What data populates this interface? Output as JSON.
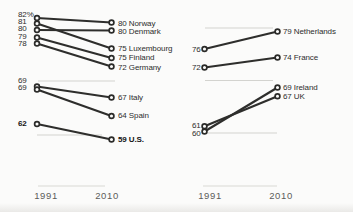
{
  "colors": {
    "slope_line": "#2e2e2c",
    "point_stroke": "#2b2b29",
    "point_fill": "#fbfbfa",
    "gridline": "#d3d3cf",
    "axis_line": "#d9d9d4",
    "label_text": "#2d2d2d",
    "bold_text": "#141414",
    "year_text": "#5d5d5a",
    "background": "#fbfbfa"
  },
  "chart_data": {
    "type": "line",
    "subtype": "slopegraph",
    "title": "",
    "x_categories": [
      "1991",
      "2010"
    ],
    "legend": "none",
    "grid": "partial-horizontal-rules",
    "panels": [
      {
        "name": "left-panel",
        "value_label_x": 18,
        "country_label_x": 118,
        "col_x_1991": 37,
        "col_x_2010": 111.5,
        "gridlines": [
          {
            "y": 81,
            "x1": 38,
            "x2": 115
          },
          {
            "y": 135,
            "x1": 37,
            "x2": 102
          }
        ],
        "axis": {
          "y": 186,
          "x1": 38,
          "x2": 105,
          "year1_cx": 46,
          "year2_cx": 107,
          "year_label_top": 190
        },
        "series": [
          {
            "country": "Norway",
            "v1991": 82,
            "v2010": 80,
            "label_left": "82%",
            "label_right": "80 Norway",
            "bold": false,
            "y1": 18,
            "y2": 22.5,
            "label_left_y": 14.5,
            "label_right_y": 24
          },
          {
            "country": "Luxembourg",
            "v1991": 81,
            "v2010": 75,
            "label_left": "81",
            "label_right": "75 Luxembourg",
            "bold": false,
            "y1": 23.5,
            "y2": 48.5,
            "label_left_y": 21.5,
            "label_right_y": 48.5
          },
          {
            "country": "Denmark",
            "v1991": 80,
            "v2010": 80,
            "label_left": "80",
            "label_right": "80 Denmark",
            "bold": false,
            "y1": 30,
            "y2": 30.5,
            "label_left_y": 29,
            "label_right_y": 31.5
          },
          {
            "country": "Finland",
            "v1991": 79,
            "v2010": 75,
            "label_left": "79",
            "label_right": "75 Finland",
            "bold": false,
            "y1": 37.5,
            "y2": 58,
            "label_left_y": 36.5,
            "label_right_y": 58
          },
          {
            "country": "Germany",
            "v1991": 78,
            "v2010": 72,
            "label_left": "78",
            "label_right": "72 Germany",
            "bold": false,
            "y1": 43.5,
            "y2": 66.5,
            "label_left_y": 44,
            "label_right_y": 67.5
          },
          {
            "country": "Italy",
            "v1991": 69,
            "v2010": 67,
            "label_left": "69",
            "label_right": "67 Italy",
            "bold": false,
            "y1": 86.5,
            "y2": 97.5,
            "label_left_y": 80.5,
            "label_right_y": 97.5
          },
          {
            "country": "Spain",
            "v1991": 69,
            "v2010": 64,
            "label_left": "69",
            "label_right": "64 Spain",
            "bold": false,
            "y1": 89.5,
            "y2": 116,
            "label_left_y": 87.5,
            "label_right_y": 116
          },
          {
            "country": "U.S.",
            "v1991": 62,
            "v2010": 59,
            "label_left": "62",
            "label_right": "59 U.S.",
            "bold": true,
            "y1": 124,
            "y2": 139.5,
            "label_left_y": 123.5,
            "label_right_y": 139.5
          }
        ]
      },
      {
        "name": "right-panel",
        "value_label_x": 192,
        "country_label_x": 283,
        "col_x_1991": 204.5,
        "col_x_2010": 277.5,
        "gridlines": [
          {
            "y": 28,
            "x1": 205,
            "x2": 273
          },
          {
            "y": 80.5,
            "x1": 205,
            "x2": 273
          },
          {
            "y": 133,
            "x1": 207,
            "x2": 277
          }
        ],
        "axis": {
          "y": 186,
          "x1": 203,
          "x2": 277,
          "year1_cx": 210,
          "year2_cx": 281,
          "year_label_top": 190
        },
        "series": [
          {
            "country": "Netherlands",
            "v1991": 76,
            "v2010": 79,
            "label_left": "76",
            "label_right": "79 Netherlands",
            "bold": false,
            "y1": 49,
            "y2": 31.5,
            "label_left_y": 50,
            "label_right_y": 31.5
          },
          {
            "country": "France",
            "v1991": 72,
            "v2010": 74,
            "label_left": "72",
            "label_right": "74 France",
            "bold": false,
            "y1": 67.5,
            "y2": 57.5,
            "label_left_y": 68,
            "label_right_y": 57.5
          },
          {
            "country": "UK",
            "v1991": 61,
            "v2010": 67,
            "label_left": "61",
            "label_right": "67 UK",
            "bold": false,
            "y1": 126.3,
            "y2": 96.3,
            "label_left_y": 126,
            "label_right_y": 96.5
          },
          {
            "country": "Ireland",
            "v1991": 60,
            "v2010": 69,
            "label_left": "60",
            "label_right": "69 Ireland",
            "bold": false,
            "y1": 131.5,
            "y2": 87.5,
            "label_left_y": 134,
            "label_right_y": 87.5
          }
        ]
      }
    ]
  }
}
